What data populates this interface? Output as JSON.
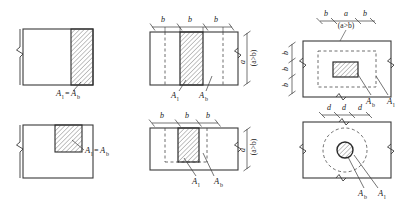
{
  "figure": {
    "title": "",
    "colors": {
      "line": "#3a3a3a",
      "hatch": "#6e6e6e",
      "dashed": "#4a4a4a",
      "text": "#1a1a1a",
      "background": "#ffffff"
    },
    "symbols": {
      "area_loaded": "A",
      "area_loaded_sub": "l",
      "area_distribution": "A",
      "area_distribution_sub": "b",
      "equals": "=",
      "dim_a": "a",
      "dim_b": "b",
      "dim_d": "d",
      "condition": "(a>b)"
    },
    "panels": [
      {
        "id": "panel-top-left",
        "name": "edge-strip-square",
        "shape": "rectangle",
        "hatch_region": "right-vertical-strip",
        "labels": [
          {
            "text": "A",
            "sub": "l"
          },
          {
            "text": "=",
            "sub": ""
          },
          {
            "text": "A",
            "sub": "b"
          }
        ],
        "caption": "Al=Ab",
        "dimensions": []
      },
      {
        "id": "panel-top-middle",
        "name": "central-strip-square",
        "shape": "rectangle",
        "hatch_region": "center-vertical-strip",
        "labels": [
          {
            "text": "A",
            "sub": "l"
          },
          {
            "text": "A",
            "sub": "b"
          }
        ],
        "dimensions": [
          {
            "text": "b",
            "orientation": "horizontal"
          },
          {
            "text": "b",
            "orientation": "horizontal"
          },
          {
            "text": "b",
            "orientation": "horizontal"
          },
          {
            "text": "a",
            "orientation": "vertical"
          }
        ],
        "condition": "(a>b)"
      },
      {
        "id": "panel-top-right",
        "name": "central-block-plan",
        "shape": "rectangle",
        "hatch_region": "center-block",
        "labels": [
          {
            "text": "A",
            "sub": "b"
          },
          {
            "text": "A",
            "sub": "l"
          }
        ],
        "dimensions": [
          {
            "text": "b",
            "orientation": "horizontal"
          },
          {
            "text": "a",
            "orientation": "horizontal"
          },
          {
            "text": "b",
            "orientation": "horizontal"
          },
          {
            "text": "b",
            "orientation": "vertical"
          },
          {
            "text": "b",
            "orientation": "vertical"
          },
          {
            "text": "b",
            "orientation": "vertical"
          }
        ],
        "condition": "(a>b)"
      },
      {
        "id": "panel-bottom-left",
        "name": "corner-block-square",
        "shape": "rectangle",
        "hatch_region": "top-right-corner-block",
        "labels": [
          {
            "text": "A",
            "sub": "l"
          },
          {
            "text": "=",
            "sub": ""
          },
          {
            "text": "A",
            "sub": "b"
          }
        ],
        "caption": "Al=Ab",
        "dimensions": []
      },
      {
        "id": "panel-bottom-middle",
        "name": "central-strip-wide",
        "shape": "rectangle",
        "hatch_region": "center-vertical-strip",
        "labels": [
          {
            "text": "A",
            "sub": "l"
          },
          {
            "text": "A",
            "sub": "b"
          }
        ],
        "dimensions": [
          {
            "text": "b",
            "orientation": "horizontal"
          },
          {
            "text": "b",
            "orientation": "horizontal"
          },
          {
            "text": "b",
            "orientation": "horizontal"
          },
          {
            "text": "a",
            "orientation": "vertical"
          }
        ],
        "condition": "(a>b)"
      },
      {
        "id": "panel-bottom-right",
        "name": "circular-bearing-plan",
        "shape": "rectangle",
        "hatch_region": "center-circle",
        "labels": [
          {
            "text": "A",
            "sub": "b"
          },
          {
            "text": "A",
            "sub": "l"
          }
        ],
        "dimensions": [
          {
            "text": "d",
            "orientation": "horizontal"
          },
          {
            "text": "d",
            "orientation": "horizontal"
          },
          {
            "text": "d",
            "orientation": "horizontal"
          }
        ],
        "condition": ""
      }
    ]
  }
}
